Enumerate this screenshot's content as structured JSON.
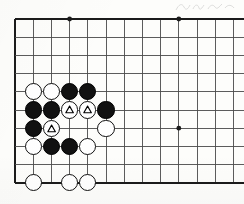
{
  "figure": {
    "board_type": "go-board"
  },
  "board": {
    "grid": {
      "origin_x": 15,
      "origin_y": 19,
      "spacing": 18.2,
      "columns": 13,
      "rows": 10,
      "line_color": "#4a4a4a",
      "edge_color": "#1b1b1b",
      "line_width": 0.9,
      "edge_width": 2.0,
      "background_color": "#fdfdfb"
    },
    "star_points": [
      {
        "col": 3,
        "row": 0,
        "label": "star-point-top-left"
      },
      {
        "col": 9,
        "row": 0,
        "label": "star-point-top-right"
      },
      {
        "col": 9,
        "row": 6,
        "label": "star-point-center-right"
      }
    ],
    "star_point_radius": 2.4,
    "stone_radius": 8.6,
    "colors": {
      "black_stone": "#111111",
      "white_stone": "#ffffff",
      "stone_outline": "#101010",
      "marker_outline": "#000000",
      "marker_fill": "#ffffff"
    }
  },
  "stones": [
    {
      "id": "w1",
      "color": "white",
      "col": 1,
      "row": 4,
      "marker": "none",
      "name": "white-stone-b5"
    },
    {
      "id": "w2",
      "color": "white",
      "col": 2,
      "row": 4,
      "marker": "none",
      "name": "white-stone-c5"
    },
    {
      "id": "b1",
      "color": "black",
      "col": 3,
      "row": 4,
      "marker": "none",
      "name": "black-stone-d5"
    },
    {
      "id": "b2",
      "color": "black",
      "col": 4,
      "row": 4,
      "marker": "none",
      "name": "black-stone-e5"
    },
    {
      "id": "b3",
      "color": "black",
      "col": 1,
      "row": 5,
      "marker": "none",
      "name": "black-stone-b4"
    },
    {
      "id": "b4",
      "color": "black",
      "col": 2,
      "row": 5,
      "marker": "none",
      "name": "black-stone-c4"
    },
    {
      "id": "w3",
      "color": "white",
      "col": 3,
      "row": 5,
      "marker": "triangle",
      "name": "white-stone-marked-d4"
    },
    {
      "id": "w4",
      "color": "white",
      "col": 4,
      "row": 5,
      "marker": "triangle",
      "name": "white-stone-marked-e4"
    },
    {
      "id": "b5",
      "color": "black",
      "col": 5,
      "row": 5,
      "marker": "none",
      "name": "black-stone-f4"
    },
    {
      "id": "b6",
      "color": "black",
      "col": 1,
      "row": 6,
      "marker": "none",
      "name": "black-stone-b3"
    },
    {
      "id": "w5",
      "color": "white",
      "col": 2,
      "row": 6,
      "marker": "triangle",
      "name": "white-stone-marked-c3"
    },
    {
      "id": "w6",
      "color": "white",
      "col": 5,
      "row": 6,
      "marker": "none",
      "name": "white-stone-f3"
    },
    {
      "id": "w7",
      "color": "white",
      "col": 1,
      "row": 7,
      "marker": "none",
      "name": "white-stone-b2"
    },
    {
      "id": "b7",
      "color": "black",
      "col": 2,
      "row": 7,
      "marker": "none",
      "name": "black-stone-c2"
    },
    {
      "id": "b8",
      "color": "black",
      "col": 3,
      "row": 7,
      "marker": "none",
      "name": "black-stone-d2"
    },
    {
      "id": "w8",
      "color": "white",
      "col": 4,
      "row": 7,
      "marker": "none",
      "name": "white-stone-e2"
    },
    {
      "id": "w9",
      "color": "white",
      "col": 1,
      "row": 9,
      "marker": "none",
      "name": "white-stone-b0"
    },
    {
      "id": "w10",
      "color": "white",
      "col": 3,
      "row": 9,
      "marker": "none",
      "name": "white-stone-d0"
    },
    {
      "id": "w11",
      "color": "white",
      "col": 4,
      "row": 9,
      "marker": "none",
      "name": "white-stone-e0"
    }
  ],
  "markers": {
    "triangle_count": 3,
    "triangle_size": 9.2
  },
  "chart_data": {
    "type": "table",
    "xlabel": "board column",
    "ylabel": "board row",
    "grid": true,
    "legend": "none",
    "categories": [
      "white stone",
      "black stone",
      "triangle-marked white stone",
      "star point"
    ],
    "values": [
      11,
      8,
      3,
      3
    ]
  }
}
